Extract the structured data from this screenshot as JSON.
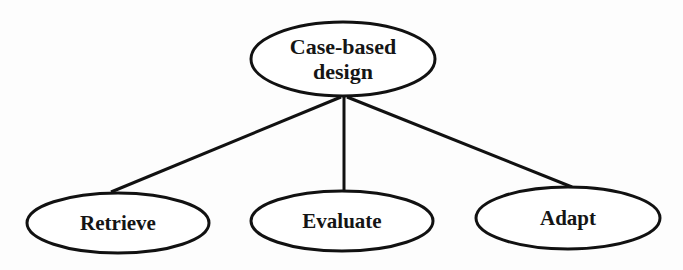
{
  "diagram": {
    "type": "tree",
    "root": {
      "id": "case-based-design",
      "label_line1": "Case-based",
      "label_line2": "design"
    },
    "children": [
      {
        "id": "retrieve",
        "label": "Retrieve"
      },
      {
        "id": "evaluate",
        "label": "Evaluate"
      },
      {
        "id": "adapt",
        "label": "Adapt"
      }
    ],
    "edges": [
      {
        "from": "case-based-design",
        "to": "retrieve"
      },
      {
        "from": "case-based-design",
        "to": "evaluate"
      },
      {
        "from": "case-based-design",
        "to": "adapt"
      }
    ],
    "colors": {
      "stroke": "#111111",
      "fill": "#ffffff",
      "text": "#151515"
    }
  }
}
